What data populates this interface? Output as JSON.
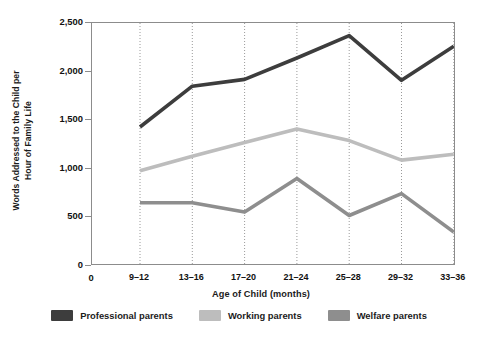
{
  "chart_data": {
    "type": "line",
    "title": "",
    "xlabel": "Age of Child (months)",
    "ylabel": "Words Addressed to the Child per Hour of Family Life",
    "ylabel_line1": "Words Addressed to the Child per",
    "ylabel_line2": "Hour of Family Life",
    "categories": [
      "9–12",
      "13–16",
      "17–20",
      "21–24",
      "25–28",
      "29–32",
      "33–36"
    ],
    "x_origin_label": "0",
    "ylim": [
      0,
      2500
    ],
    "yticks": [
      0,
      500,
      1000,
      1500,
      2000,
      2500
    ],
    "ytick_labels": [
      "0",
      "500",
      "1,000",
      "1,500",
      "2,000",
      "2,500"
    ],
    "grid": "vertical dotted gridlines at each category",
    "legend_position": "below plot, horizontal",
    "series": [
      {
        "name": "Professional parents",
        "color": "#3d3d3d",
        "values": [
          1430,
          1850,
          1920,
          2140,
          2370,
          1910,
          2260
        ]
      },
      {
        "name": "Working parents",
        "color": "#bdbdbd",
        "values": [
          980,
          1130,
          1270,
          1410,
          1290,
          1090,
          1150
        ]
      },
      {
        "name": "Welfare parents",
        "color": "#8e8e8e",
        "values": [
          650,
          650,
          555,
          900,
          520,
          745,
          350
        ]
      }
    ]
  },
  "legend": {
    "items": [
      {
        "label": "Professional parents",
        "color": "#3d3d3d"
      },
      {
        "label": "Working parents",
        "color": "#bdbdbd"
      },
      {
        "label": "Welfare parents",
        "color": "#8e8e8e"
      }
    ]
  }
}
